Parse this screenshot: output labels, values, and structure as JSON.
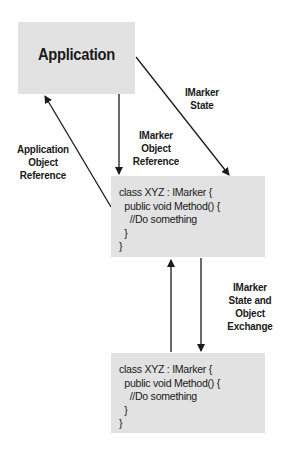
{
  "diagram": {
    "nodes": {
      "application": {
        "label": "Application"
      },
      "marker_object_1": {
        "code": [
          "class XYZ : IMarker {",
          "  public void Method() {",
          "    //Do something",
          "  }",
          "}"
        ]
      },
      "marker_object_2": {
        "code": [
          "class XYZ : IMarker {",
          "  public void Method() {",
          "    //Do something",
          "  }",
          "}"
        ]
      }
    },
    "edges": [
      {
        "from": "application",
        "to": "marker_object_1",
        "label": [
          "IMarker",
          "State"
        ]
      },
      {
        "from": "application",
        "to": "marker_object_1",
        "label": [
          "IMarker",
          "Object",
          "Reference"
        ]
      },
      {
        "from": "marker_object_1",
        "to": "application",
        "label": [
          "Application",
          "Object",
          "Reference"
        ]
      },
      {
        "from": "marker_object_1",
        "to": "marker_object_2",
        "label": [
          "IMarker",
          "State and",
          "Object",
          "Exchange"
        ]
      },
      {
        "from": "marker_object_2",
        "to": "marker_object_1",
        "label": []
      }
    ],
    "colors": {
      "box_fill": "#e2e2e2",
      "line": "#1a1a1a"
    }
  }
}
